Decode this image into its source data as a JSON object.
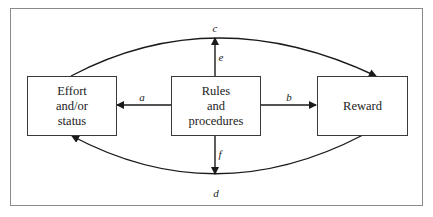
{
  "diagram": {
    "boxes": {
      "effort": {
        "lines": [
          "Effort",
          "and/or",
          "status"
        ]
      },
      "rules": {
        "lines": [
          "Rules",
          "and",
          "procedures"
        ]
      },
      "reward": {
        "lines": [
          "Reward"
        ]
      }
    },
    "edges": [
      {
        "id": "a",
        "label": "a",
        "from": "rules",
        "to": "effort",
        "shape": "straight"
      },
      {
        "id": "b",
        "label": "b",
        "from": "rules",
        "to": "reward",
        "shape": "straight"
      },
      {
        "id": "c",
        "label": "c",
        "from": "effort",
        "to": "reward",
        "shape": "upper-arc"
      },
      {
        "id": "d",
        "label": "d",
        "from": "reward",
        "to": "effort",
        "shape": "lower-arc"
      },
      {
        "id": "e",
        "label": "e",
        "from": "rules",
        "to": "c",
        "shape": "straight-up"
      },
      {
        "id": "f",
        "label": "f",
        "from": "rules",
        "to": "d",
        "shape": "straight-down"
      }
    ],
    "colors": {
      "line": "#1a1a1a",
      "frame": "#8a8a8a",
      "text": "#222222"
    }
  },
  "caption": {
    "text": ""
  }
}
